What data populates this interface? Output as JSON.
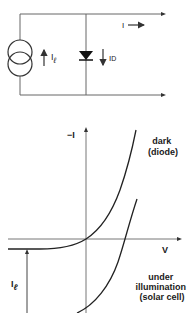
{
  "circuit": {
    "output_current_label": "I",
    "source_current_label": "I",
    "source_current_subscript": "ℓ",
    "diode_current_label": "I",
    "diode_current_subscript": "D",
    "components": [
      "current-source",
      "diode"
    ],
    "line_color": "#555555"
  },
  "plot": {
    "y_axis_label": "−I",
    "x_axis_label": "V",
    "curves": [
      {
        "name": "dark",
        "label_line1": "dark",
        "label_line2": "(diode)"
      },
      {
        "name": "illuminated",
        "label_line1": "under",
        "label_line2": "illumination",
        "label_line3": "(solar cell)"
      }
    ],
    "offset_label": "I",
    "offset_subscript": "ℓ",
    "curve_color": "#222222",
    "axis_color": "#777777"
  }
}
